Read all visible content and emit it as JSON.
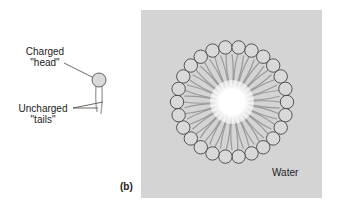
{
  "panel_label": "(b)",
  "molecule": {
    "head_label_line1": "Charged",
    "head_label_line2": "\"head\"",
    "tails_label_line1": "Uncharged",
    "tails_label_line2": "\"tails\""
  },
  "micelle": {
    "medium_label": "Water",
    "head_count": 26,
    "colors": {
      "background": "#d4d4d4",
      "head_fill": "#d9d9d9",
      "head_stroke": "#333333",
      "tail": "#9a9a9a",
      "core": "#ffffff"
    }
  }
}
